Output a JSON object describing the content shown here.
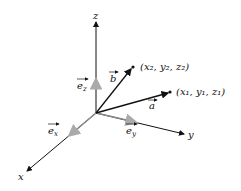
{
  "diagram": {
    "axes": {
      "x": {
        "label": "x"
      },
      "y": {
        "label": "y"
      },
      "z": {
        "label": "z"
      }
    },
    "unit_vectors": {
      "ex": {
        "label": "e",
        "sub": "x"
      },
      "ey": {
        "label": "e",
        "sub": "y"
      },
      "ez": {
        "label": "e",
        "sub": "z"
      }
    },
    "vectors": {
      "a": {
        "label": "a",
        "point": "(x₁, y₁, z₁)"
      },
      "b": {
        "label": "b",
        "point": "(x₂, y₂, z₂)"
      }
    },
    "colors": {
      "axis": "#111111",
      "unit_vector": "#999999"
    }
  }
}
